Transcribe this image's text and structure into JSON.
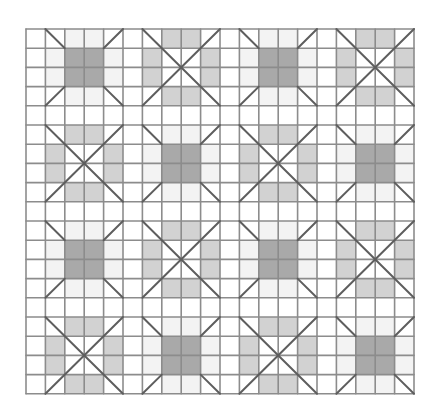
{
  "diagram": {
    "kind": "quilt-grid-pattern",
    "grid": {
      "left": 26,
      "top": 29,
      "cols": 20,
      "rows": 19,
      "cell_w": 19.4,
      "cell_h": 19.2,
      "line_color": "#8c8c8c",
      "diagonal_color": "#5e5e5e",
      "background": "#ffffff"
    },
    "layout": {
      "block_size": 4,
      "sash_cells": 1,
      "block_cols_start": [
        1,
        6,
        11,
        16
      ],
      "block_rows_start": [
        0,
        5,
        10,
        15
      ]
    },
    "block_types": {
      "A": {
        "name": "dark-center-corner-diagonals",
        "center_fill": "#a9a9a9",
        "edge_fill": "#f3f3f3",
        "corner_diagonals": true
      },
      "B": {
        "name": "x-cross-light-bars",
        "bar_fill": "#d2d2d2",
        "full_x": true
      }
    },
    "blocks": [
      [
        "A",
        "B",
        "A",
        "B"
      ],
      [
        "B",
        "A",
        "B",
        "A"
      ],
      [
        "A",
        "B",
        "A",
        "B"
      ],
      [
        "B",
        "A",
        "B",
        "A"
      ]
    ]
  }
}
